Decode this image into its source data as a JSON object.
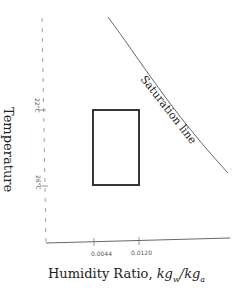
{
  "diagram": {
    "type": "psychrometric comfort zone",
    "y_axis_label": "Temperature",
    "x_axis_label_prefix": "Humidity Ratio, ",
    "x_axis_label_math": "kg_w / kg_a",
    "curve_label": "Saturation line",
    "y_ticks": [
      "22°C",
      "26°C"
    ],
    "x_ticks": [
      "0.0044",
      "0.0120"
    ],
    "comfort_box": {
      "humidity_min": 0.0044,
      "humidity_max": 0.012,
      "temp_min_c": 22,
      "temp_max_c": 26
    }
  }
}
